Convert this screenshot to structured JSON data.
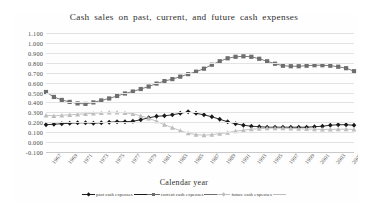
{
  "figure": {
    "title": "Cash sales on past, current, and future cash expenses",
    "xlabel": "Calendar year"
  },
  "legend": {
    "items": [
      {
        "label": "past cash expenses",
        "color": "#1a1a1a",
        "marker": "diamond"
      },
      {
        "label": "current cash expenses",
        "color": "#6e6e6e",
        "marker": "square"
      },
      {
        "label": "future cash expenses",
        "color": "#bdbdbd",
        "marker": "triangle"
      }
    ]
  },
  "chart_data": {
    "type": "line",
    "title": "Cash sales on past, current, and future cash expenses",
    "xlabel": "Calendar year",
    "ylabel": "",
    "ylim": [
      -0.1,
      1.1
    ],
    "ytick_labels": [
      "1.100",
      "1.000",
      "0.900",
      "0.800",
      "0.700",
      "0.600",
      "0.500",
      "0.400",
      "0.300",
      "0.200",
      "0.100",
      "0.000",
      "-0.100"
    ],
    "ytick_values": [
      1.1,
      1.0,
      0.9,
      0.8,
      0.7,
      0.6,
      0.5,
      0.4,
      0.3,
      0.2,
      0.1,
      0.0,
      -0.1
    ],
    "grid": true,
    "legend_position": "bottom",
    "x": [
      1966,
      1967,
      1968,
      1969,
      1970,
      1971,
      1972,
      1973,
      1974,
      1975,
      1976,
      1977,
      1978,
      1979,
      1980,
      1981,
      1982,
      1983,
      1984,
      1985,
      1986,
      1987,
      1988,
      1989,
      1990,
      1991,
      1992,
      1993,
      1994,
      1995,
      1996,
      1997,
      1998,
      1999,
      2000,
      2001,
      2002,
      2003,
      2004,
      2005
    ],
    "xtick_labels": [
      "1967",
      "1969",
      "1971",
      "1973",
      "1975",
      "1977",
      "1979",
      "1981",
      "1983",
      "1985",
      "1987",
      "1989",
      "1991",
      "1993",
      "1995",
      "1997",
      "1999",
      "2001",
      "2003",
      "2005"
    ],
    "xtick_values": [
      1967,
      1969,
      1971,
      1973,
      1975,
      1977,
      1979,
      1981,
      1983,
      1985,
      1987,
      1989,
      1991,
      1993,
      1995,
      1997,
      1999,
      2001,
      2003,
      2005
    ],
    "series": [
      {
        "name": "past cash expenses",
        "color": "#1a1a1a",
        "marker": "diamond",
        "values": [
          0.175,
          0.18,
          0.185,
          0.19,
          0.195,
          0.195,
          0.19,
          0.195,
          0.2,
          0.205,
          0.205,
          0.21,
          0.225,
          0.245,
          0.26,
          0.265,
          0.275,
          0.29,
          0.305,
          0.29,
          0.275,
          0.255,
          0.23,
          0.205,
          0.185,
          0.17,
          0.16,
          0.155,
          0.15,
          0.15,
          0.15,
          0.15,
          0.15,
          0.15,
          0.155,
          0.16,
          0.17,
          0.175,
          0.175,
          0.17
        ]
      },
      {
        "name": "current cash expenses",
        "color": "#6e6e6e",
        "marker": "square",
        "values": [
          0.505,
          0.455,
          0.425,
          0.405,
          0.39,
          0.385,
          0.4,
          0.42,
          0.44,
          0.465,
          0.49,
          0.51,
          0.535,
          0.56,
          0.59,
          0.615,
          0.635,
          0.66,
          0.685,
          0.71,
          0.74,
          0.78,
          0.815,
          0.845,
          0.86,
          0.865,
          0.86,
          0.84,
          0.815,
          0.79,
          0.77,
          0.765,
          0.765,
          0.77,
          0.775,
          0.775,
          0.77,
          0.76,
          0.745,
          0.715
        ]
      },
      {
        "name": "future cash expenses",
        "color": "#bdbdbd",
        "marker": "triangle",
        "values": [
          0.27,
          0.265,
          0.27,
          0.275,
          0.28,
          0.285,
          0.29,
          0.295,
          0.3,
          0.3,
          0.295,
          0.285,
          0.265,
          0.24,
          0.21,
          0.175,
          0.145,
          0.115,
          0.09,
          0.075,
          0.07,
          0.075,
          0.085,
          0.095,
          0.11,
          0.12,
          0.13,
          0.135,
          0.14,
          0.14,
          0.14,
          0.138,
          0.135,
          0.132,
          0.13,
          0.128,
          0.128,
          0.13,
          0.13,
          0.128
        ]
      }
    ]
  }
}
